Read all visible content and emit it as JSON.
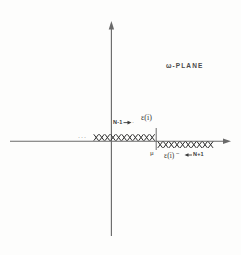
{
  "figure": {
    "title_label": "ω-PLANE",
    "background_color": "#fdfdfc",
    "ink_color": "#3a3a3a",
    "width": 241,
    "height": 255
  },
  "axes": {
    "horizontal": {
      "name": "real-axis",
      "x_start": 10,
      "x_end": 231,
      "y": 141,
      "arrow_at": "right"
    },
    "vertical": {
      "name": "imaginary-axis",
      "x": 111,
      "y_start": 22,
      "y_end": 236,
      "arrow_at": "top"
    },
    "origin": {
      "x": 111,
      "y": 141
    }
  },
  "markers": {
    "left_branch": {
      "name": "upper-cross-row",
      "glyph": "x",
      "count": 11,
      "x_start": 94,
      "spacing": 5.6,
      "y": 138,
      "position": "above-axis",
      "leading_ellipsis": "···"
    },
    "right_branch": {
      "name": "lower-cross-row",
      "glyph": "x",
      "count": 10,
      "x_start": 158,
      "spacing": 5.6,
      "y": 145,
      "position": "below-axis"
    }
  },
  "tick": {
    "name": "mu-tick",
    "x": 156,
    "y_top": 128,
    "y_bottom": 150
  },
  "labels": {
    "plane": "ω-PLANE",
    "epsilon_upper": "ε(i)",
    "epsilon_lower": "ε(i)",
    "epsilon_lower_sup": "−",
    "n_minus_1": "N-1",
    "n_plus_1": "N+1",
    "mu": "μ",
    "ellipsis_left": "···",
    "ellipsis_mid": "··"
  },
  "arrows": {
    "n_minus_1_arrow": {
      "name": "n-minus-1-arrow",
      "from_x": 124,
      "to_x": 131,
      "y": 122,
      "direction": "right"
    },
    "n_plus_1_arrow": {
      "name": "n-plus-1-arrow",
      "from_x": 192,
      "to_x": 185,
      "y": 155,
      "direction": "left"
    }
  }
}
